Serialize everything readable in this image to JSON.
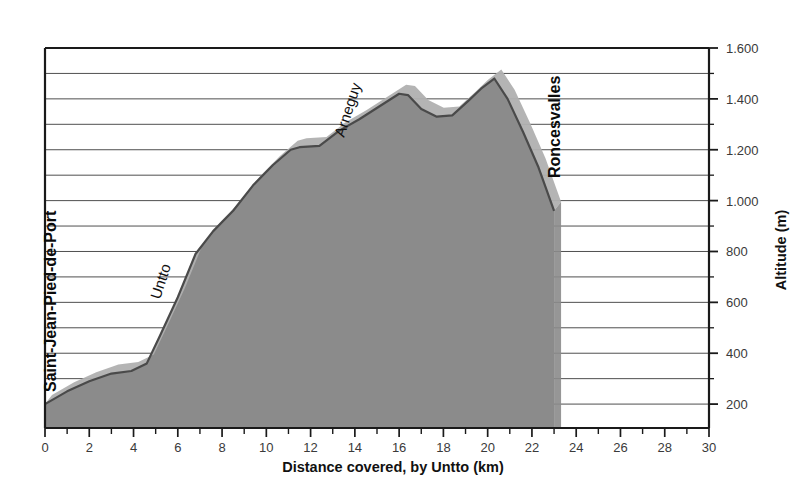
{
  "chart_data": {
    "type": "area",
    "title": "",
    "xlabel": "Distance covered, by Untto (km)",
    "ylabel": "Altitude (m)",
    "xlim": [
      0,
      30
    ],
    "ylim": [
      106,
      1600
    ],
    "grid": true,
    "legend": "none",
    "x_ticks": [
      0,
      2,
      4,
      6,
      8,
      10,
      12,
      14,
      16,
      18,
      20,
      22,
      24,
      26,
      28,
      30
    ],
    "x_tick_labels": [
      "0",
      "2",
      "4",
      "6",
      "8",
      "10",
      "12",
      "14",
      "16",
      "18",
      "20",
      "22",
      "24",
      "26",
      "28",
      "30"
    ],
    "x_minor_ticks": [
      1,
      3,
      5,
      7,
      9,
      11,
      13,
      15,
      17,
      19,
      21,
      23,
      25,
      27,
      29
    ],
    "y_ticks": [
      200,
      400,
      600,
      800,
      1000,
      1200,
      1400,
      1600
    ],
    "y_tick_labels": [
      "200",
      "400",
      "600",
      "800",
      "1.000",
      "1.200",
      "1.400",
      "1.600"
    ],
    "y_gridlines": [
      200,
      300,
      400,
      500,
      600,
      700,
      800,
      900,
      1000,
      1100,
      1200,
      1300,
      1400,
      1500,
      1600
    ],
    "series": [
      {
        "name": "Elevation profile",
        "x": [
          0.0,
          1.0,
          2.0,
          3.0,
          3.9,
          4.6,
          5.2,
          6.0,
          6.8,
          7.6,
          8.5,
          9.4,
          10.3,
          11.1,
          11.5,
          12.4,
          13.3,
          14.2,
          15.1,
          16.0,
          16.4,
          17.0,
          17.7,
          18.4,
          19.1,
          19.7,
          20.3,
          20.9,
          21.6,
          22.3,
          23.0,
          23.0
        ],
        "y": [
          200,
          250,
          290,
          320,
          330,
          360,
          470,
          620,
          790,
          880,
          960,
          1060,
          1140,
          1200,
          1210,
          1215,
          1275,
          1320,
          1370,
          1420,
          1415,
          1360,
          1330,
          1335,
          1390,
          1440,
          1480,
          1400,
          1270,
          1130,
          960,
          106
        ]
      }
    ],
    "annotations": [
      {
        "name": "Saint-Jean-Pied-de-Port",
        "label": "Saint-Jean-Pied-de-Port",
        "km": 0,
        "altitude": 200,
        "bold": true
      },
      {
        "name": "Untto",
        "label": "Untto",
        "km": 5,
        "altitude": 700,
        "bold": false
      },
      {
        "name": "Arneguy",
        "label": "Arneguy",
        "km": 14,
        "altitude": 1480,
        "bold": false
      },
      {
        "name": "Roncesvalles",
        "label": "Roncesvalles",
        "km": 23,
        "altitude": 960,
        "bold": true
      }
    ],
    "colors": {
      "fill": "#8b8b8b",
      "ridge_light": "#b0b0b0",
      "ridge_line": "#4a4a4a",
      "grid": "#4f4f4f",
      "axis": "#1a1a1a",
      "background": "#ffffff",
      "text": "#1a1a1a"
    }
  }
}
